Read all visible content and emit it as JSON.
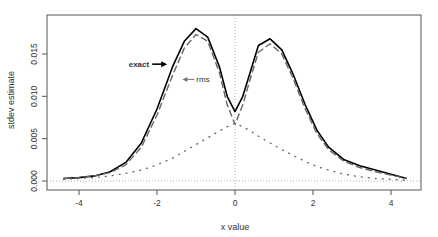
{
  "chart_data": {
    "type": "line",
    "title": "",
    "xlabel": "x value",
    "ylabel": "stdev estimate",
    "xlim": [
      -4.7,
      4.7
    ],
    "ylim": [
      -0.001,
      0.0195
    ],
    "xticks": [
      -4,
      -2,
      0,
      2,
      4
    ],
    "xtick_labels": [
      "-4",
      "-2",
      "0",
      "2",
      "4"
    ],
    "yticks": [
      0.0,
      0.005,
      0.01,
      0.015
    ],
    "ytick_labels": [
      "0.000",
      "0.005",
      "0.010",
      "0.015"
    ],
    "grid": false,
    "reference_lines": [
      {
        "orientation": "horizontal",
        "value": 0.0,
        "style": "dotted"
      },
      {
        "orientation": "vertical",
        "value": 0.0,
        "style": "dotted"
      }
    ],
    "x": [
      -4.4,
      -4.0,
      -3.6,
      -3.2,
      -2.8,
      -2.4,
      -2.0,
      -1.6,
      -1.3,
      -1.0,
      -0.7,
      -0.4,
      -0.2,
      0.0,
      0.2,
      0.4,
      0.6,
      0.9,
      1.2,
      1.5,
      1.8,
      2.1,
      2.4,
      2.8,
      3.2,
      3.6,
      4.0,
      4.4
    ],
    "series": [
      {
        "name": "exact",
        "style": "solid",
        "color": "#000000",
        "values": [
          0.0003,
          0.0004,
          0.0006,
          0.0011,
          0.0022,
          0.0045,
          0.0085,
          0.0135,
          0.0165,
          0.018,
          0.017,
          0.0135,
          0.01,
          0.0082,
          0.01,
          0.013,
          0.016,
          0.0168,
          0.0155,
          0.0125,
          0.009,
          0.006,
          0.004,
          0.0025,
          0.0018,
          0.0013,
          0.0008,
          0.0003
        ]
      },
      {
        "name": "rms",
        "style": "dashed",
        "color": "#666666",
        "values": [
          0.0003,
          0.0004,
          0.0006,
          0.001,
          0.0019,
          0.004,
          0.0078,
          0.0125,
          0.0157,
          0.0173,
          0.0165,
          0.0128,
          0.009,
          0.0067,
          0.009,
          0.0122,
          0.0152,
          0.0162,
          0.015,
          0.012,
          0.0085,
          0.0056,
          0.0037,
          0.0023,
          0.0016,
          0.0011,
          0.0007,
          0.0003
        ]
      },
      {
        "name": "baseline",
        "style": "dotted",
        "color": "#666666",
        "values": [
          0.0002,
          0.0003,
          0.0004,
          0.0006,
          0.0009,
          0.0013,
          0.0019,
          0.0027,
          0.0035,
          0.0043,
          0.0051,
          0.0059,
          0.0064,
          0.0068,
          0.0064,
          0.0059,
          0.0053,
          0.0045,
          0.0037,
          0.003,
          0.0023,
          0.0017,
          0.0013,
          0.0008,
          0.0005,
          0.0003,
          0.0002,
          0.0001
        ]
      }
    ],
    "annotations": [
      {
        "text": "exact",
        "arrow": "right",
        "x": -2.2,
        "y": 0.0138
      },
      {
        "text": "rms",
        "arrow": "left",
        "x": -1.35,
        "y": 0.012
      }
    ]
  }
}
